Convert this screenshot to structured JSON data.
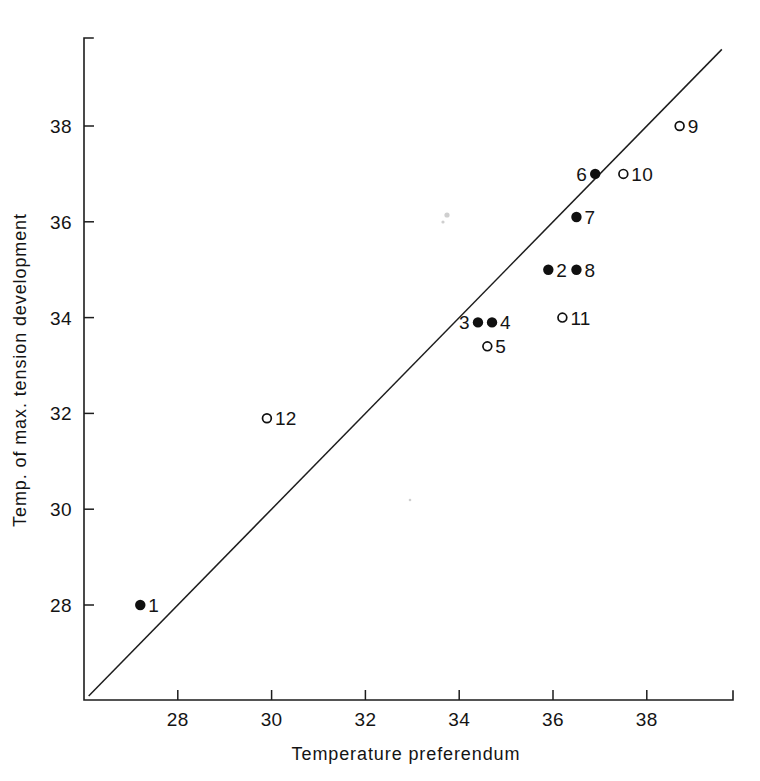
{
  "figure": {
    "background_color": "#ffffff",
    "ink_color": "#141414"
  },
  "chart_data": {
    "type": "scatter",
    "title": "",
    "xlabel": "Temperature preferendum",
    "ylabel": "Temp. of max. tension development",
    "xlim": [
      26.0,
      39.8
    ],
    "ylim": [
      26.0,
      39.7
    ],
    "xticks": [
      28,
      30,
      32,
      34,
      36,
      38
    ],
    "yticks": [
      28,
      30,
      32,
      34,
      36,
      38
    ],
    "xtick_labels": [
      "28",
      "30",
      "32",
      "34",
      "36",
      "38"
    ],
    "ytick_labels": [
      "28",
      "30",
      "32",
      "34",
      "36",
      "38"
    ],
    "grid": false,
    "legend": false,
    "reference_line": {
      "name": "identity-line",
      "type": "line",
      "slope": 1,
      "intercept": 0,
      "x_start": 26.1,
      "x_end": 39.6,
      "y_start": 26.1,
      "y_end": 39.6
    },
    "marker_styles": {
      "filled": "closed-circle",
      "open": "open-circle"
    },
    "points": [
      {
        "label": "1",
        "x": 27.2,
        "y": 28.0,
        "marker": "filled",
        "label_side": "right"
      },
      {
        "label": "2",
        "x": 35.9,
        "y": 35.0,
        "marker": "filled",
        "label_side": "right"
      },
      {
        "label": "3",
        "x": 34.4,
        "y": 33.9,
        "marker": "filled",
        "label_side": "left"
      },
      {
        "label": "4",
        "x": 34.7,
        "y": 33.9,
        "marker": "filled",
        "label_side": "right"
      },
      {
        "label": "5",
        "x": 34.6,
        "y": 33.4,
        "marker": "open",
        "label_side": "right"
      },
      {
        "label": "6",
        "x": 36.9,
        "y": 37.0,
        "marker": "filled",
        "label_side": "left"
      },
      {
        "label": "7",
        "x": 36.5,
        "y": 36.1,
        "marker": "filled",
        "label_side": "right"
      },
      {
        "label": "8",
        "x": 36.5,
        "y": 35.0,
        "marker": "filled",
        "label_side": "right"
      },
      {
        "label": "9",
        "x": 38.7,
        "y": 38.0,
        "marker": "open",
        "label_side": "right"
      },
      {
        "label": "10",
        "x": 37.5,
        "y": 37.0,
        "marker": "open",
        "label_side": "right"
      },
      {
        "label": "11",
        "x": 36.2,
        "y": 34.0,
        "marker": "open",
        "label_side": "right"
      },
      {
        "label": "12",
        "x": 29.9,
        "y": 31.9,
        "marker": "open",
        "label_side": "right"
      }
    ]
  }
}
